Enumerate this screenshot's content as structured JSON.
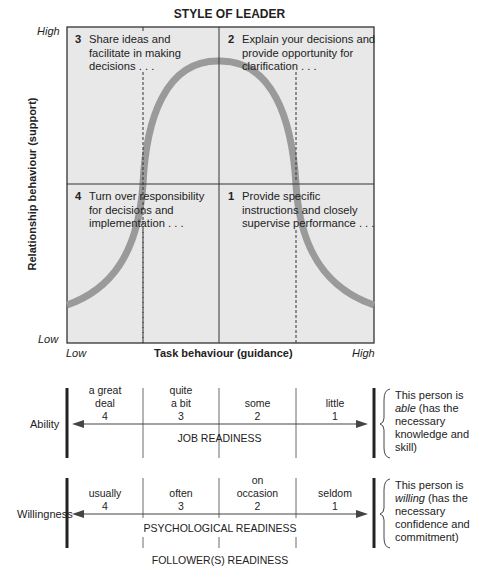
{
  "title": "STYLE OF LEADER",
  "y_axis": {
    "label": "Relationship behaviour (support)",
    "high": "High",
    "low": "Low"
  },
  "x_axis": {
    "label": "Task behaviour (guidance)",
    "low": "Low",
    "high": "High"
  },
  "quadrants": [
    {
      "num": "3",
      "lines": [
        "Share ideas and",
        "facilitate in making",
        "decisions . . ."
      ]
    },
    {
      "num": "2",
      "lines": [
        "Explain your decisions and",
        "provide opportunity for",
        "clarification . . ."
      ]
    },
    {
      "num": "4",
      "lines": [
        "Turn over responsibility",
        "for decisions and",
        "implementation . . ."
      ]
    },
    {
      "num": "1",
      "lines": [
        "Provide specific",
        "instructions and closely",
        "supervise performance . . ."
      ]
    }
  ],
  "ability": {
    "label": "Ability",
    "levels": [
      {
        "text": [
          "a great",
          "deal"
        ],
        "num": "4"
      },
      {
        "text": [
          "quite",
          "a bit"
        ],
        "num": "3"
      },
      {
        "text": [
          "some"
        ],
        "num": "2"
      },
      {
        "text": [
          "little"
        ],
        "num": "1"
      }
    ],
    "readiness": "JOB READINESS",
    "note": {
      "pre": "This person is",
      "em": "able",
      "post": " (has the",
      "rest": [
        "necessary",
        "knowledge and",
        "skill)"
      ]
    }
  },
  "willingness": {
    "label": "Willingness",
    "levels": [
      {
        "text": [
          "usually"
        ],
        "num": "4"
      },
      {
        "text": [
          "often"
        ],
        "num": "3"
      },
      {
        "text": [
          "on",
          "occasion"
        ],
        "num": "2"
      },
      {
        "text": [
          "seldom"
        ],
        "num": "1"
      }
    ],
    "readiness": "PSYCHOLOGICAL READINESS",
    "note": {
      "pre": "This person is",
      "em": "willing",
      "post": " (has the",
      "rest": [
        "necessary",
        "confidence and",
        "commitment)"
      ]
    }
  },
  "footer": "FOLLOWER(S) READINESS",
  "colors": {
    "grid_bg": "#e8e8e8",
    "curve": "#9a9a9a",
    "line": "#333333"
  }
}
